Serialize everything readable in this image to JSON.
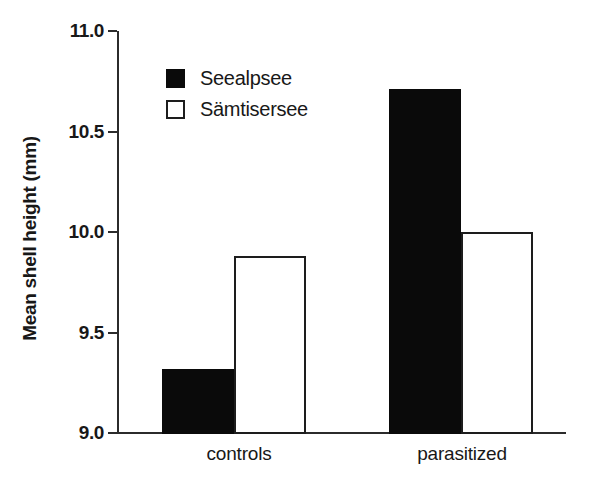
{
  "chart_data": {
    "type": "bar",
    "title": "",
    "subtitle": "",
    "xlabel": "",
    "ylabel": "Mean shell height (mm)",
    "categories": [
      "controls",
      "parasitized"
    ],
    "series": [
      {
        "name": "Seealpsee",
        "values": [
          9.32,
          10.71
        ],
        "color": "#0a0a0a",
        "style": "filled"
      },
      {
        "name": "Sämtisersee",
        "values": [
          9.88,
          10.0
        ],
        "color": "#ffffff",
        "style": "hollow"
      }
    ],
    "ylim": [
      9.0,
      11.0
    ],
    "yticks": [
      9.0,
      9.5,
      10.0,
      10.5,
      11.0
    ],
    "ytick_labels": [
      "9.0",
      "9.5",
      "10.0",
      "10.5",
      "11.0"
    ],
    "grid": false,
    "legend_position": "upper-left-inside",
    "legend_entries": [
      "Seealpsee",
      "Sämtisersee"
    ]
  },
  "axis": {
    "y_title": "Mean shell height (mm)",
    "y_tick_labels": [
      "11.0",
      "10.5",
      "10.0",
      "9.5",
      "9.0"
    ],
    "x_tick_labels": [
      "controls",
      "parasitized"
    ]
  },
  "legend": {
    "items": [
      {
        "label": "Seealpsee",
        "swatch": "filled-square-swatch"
      },
      {
        "label": "Sämtisersee",
        "swatch": "hollow-square-swatch"
      }
    ]
  },
  "bars": [
    {
      "group": "controls",
      "series": "Seealpsee",
      "value": 9.32,
      "style": "filled"
    },
    {
      "group": "controls",
      "series": "Sämtisersee",
      "value": 9.88,
      "style": "hollow"
    },
    {
      "group": "parasitized",
      "series": "Seealpsee",
      "value": 10.71,
      "style": "filled"
    },
    {
      "group": "parasitized",
      "series": "Sämtisersee",
      "value": 10.0,
      "style": "hollow"
    }
  ]
}
